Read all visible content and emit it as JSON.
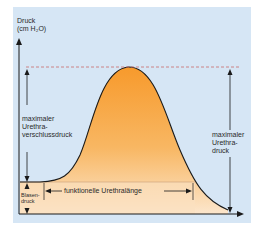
{
  "diagram": {
    "y_axis_label_line1": "Druck",
    "y_axis_label_line2": "(cm H₂O)",
    "left_measure_line1": "maximaler",
    "left_measure_line2": "Urethra-",
    "left_measure_line3": "verschlussdruck",
    "bladder_line1": "Blasen-",
    "bladder_line2": "druck",
    "functional_length": "funktionelle Urethralänge",
    "right_measure_line1": "maximaler",
    "right_measure_line2": "Urethra-",
    "right_measure_line3": "druck",
    "colors": {
      "background": "#d6e6f5",
      "curve_top": "#f7a23a",
      "curve_bottom": "#fbe3c6",
      "dashed_line": "#c96a6a",
      "axis": "#1a1a1a"
    }
  }
}
